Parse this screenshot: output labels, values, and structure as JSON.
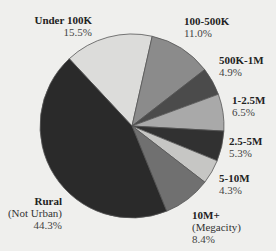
{
  "chart_data": {
    "type": "pie",
    "title": "",
    "start_bearing_deg": -43,
    "direction": "clockwise",
    "center": [
      132,
      126
    ],
    "radius": 92,
    "slices": [
      {
        "label": "Under 100K",
        "sublabel": "",
        "value": 15.5,
        "pct_text": "15.5%",
        "color": "#dcdcda"
      },
      {
        "label": "100-500K",
        "sublabel": "",
        "value": 11.0,
        "pct_text": "11.0%",
        "color": "#8b8b8b"
      },
      {
        "label": "500K-1M",
        "sublabel": "",
        "value": 4.9,
        "pct_text": "4.9%",
        "color": "#4b4b4b"
      },
      {
        "label": "1-2.5M",
        "sublabel": "",
        "value": 6.5,
        "pct_text": "6.5%",
        "color": "#a9a9a9"
      },
      {
        "label": "2.5-5M",
        "sublabel": "",
        "value": 5.3,
        "pct_text": "5.3%",
        "color": "#313131"
      },
      {
        "label": "5-10M",
        "sublabel": "",
        "value": 4.3,
        "pct_text": "4.3%",
        "color": "#c6c6c4"
      },
      {
        "label": "10M+",
        "sublabel": "(Megacity)",
        "value": 8.4,
        "pct_text": "8.4%",
        "color": "#707070"
      },
      {
        "label": "Rural",
        "sublabel": "(Not Urban)",
        "value": 44.3,
        "pct_text": "44.3%",
        "color": "#2a2a2a"
      }
    ],
    "legend": "none (direct labels)",
    "units": "%"
  },
  "labels": {
    "under100k": {
      "name": "Under 100K",
      "pct": "15.5%"
    },
    "k100_500": {
      "name": "100-500K",
      "pct": "11.0%"
    },
    "k500_1m": {
      "name": "500K-1M",
      "pct": "4.9%"
    },
    "m1_25": {
      "name": "1-2.5M",
      "pct": "6.5%"
    },
    "m25_5": {
      "name": "2.5-5M",
      "pct": "5.3%"
    },
    "m5_10": {
      "name": "5-10M",
      "pct": "4.3%"
    },
    "m10plus": {
      "name": "10M+",
      "sub": "(Megacity)",
      "pct": "8.4%"
    },
    "rural": {
      "name": "Rural",
      "sub": "(Not Urban)",
      "pct": "44.3%"
    }
  }
}
